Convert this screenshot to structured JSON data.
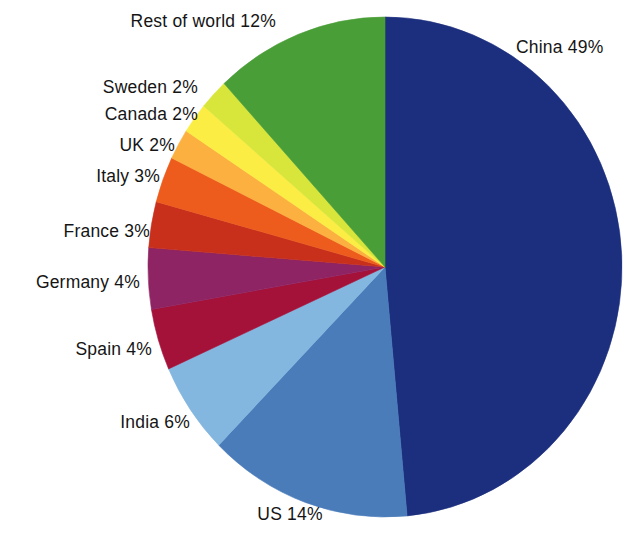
{
  "figure": {
    "type": "pie-chart",
    "background_color": "#ffffff",
    "label_text_color": "#151515",
    "center_x": 385,
    "center_y": 267,
    "radius_x": 237,
    "radius_y": 250,
    "start_angle_deg": -90,
    "direction": "clockwise"
  },
  "chart_data": {
    "type": "pie",
    "title": "",
    "xlabel": "",
    "ylabel": "",
    "legend_position": "none",
    "grid": false,
    "labels_show_percent": true,
    "total_percent": 101,
    "categories": [
      "China",
      "US",
      "India",
      "Spain",
      "Germany",
      "France",
      "Italy",
      "UK",
      "Canada",
      "Sweden",
      "Rest of world"
    ],
    "values": [
      49,
      14,
      6,
      4,
      4,
      3,
      3,
      2,
      2,
      2,
      12
    ],
    "colors": [
      "#1c2f7e",
      "#4a7cba",
      "#83b7e0",
      "#a4123a",
      "#8e2463",
      "#c8301c",
      "#ed5c1c",
      "#fbb040",
      "#fbed43",
      "#d8e53a",
      "#4a9e37"
    ],
    "slices": [
      {
        "label": "China 49%",
        "name": "China",
        "value": 49,
        "color": "#1c2f7e"
      },
      {
        "label": "US 14%",
        "name": "US",
        "value": 14,
        "color": "#4a7cba"
      },
      {
        "label": "India 6%",
        "name": "India",
        "value": 6,
        "color": "#83b7e0"
      },
      {
        "label": "Spain 4%",
        "name": "Spain",
        "value": 4,
        "color": "#a4123a"
      },
      {
        "label": "Germany 4%",
        "name": "Germany",
        "value": 4,
        "color": "#8e2463"
      },
      {
        "label": "France 3%",
        "name": "France",
        "value": 3,
        "color": "#c8301c"
      },
      {
        "label": "Italy 3%",
        "name": "Italy",
        "value": 3,
        "color": "#ed5c1c"
      },
      {
        "label": "UK 2%",
        "name": "UK",
        "value": 2,
        "color": "#fbb040"
      },
      {
        "label": "Canada 2%",
        "name": "Canada",
        "value": 2,
        "color": "#fbed43"
      },
      {
        "label": "Sweden 2%",
        "name": "Sweden",
        "value": 2,
        "color": "#d8e53a"
      },
      {
        "label": "Rest of world 12%",
        "name": "Rest of world",
        "value": 12,
        "color": "#4a9e37"
      }
    ]
  },
  "labels": {
    "china": {
      "text": "China 49%",
      "x": 516,
      "y": 38,
      "align": "left"
    },
    "rest_of_world": {
      "text": "Rest of world 12%",
      "x": 276,
      "y": 12,
      "align": "right"
    },
    "sweden": {
      "text": "Sweden 2%",
      "x": 198,
      "y": 78,
      "align": "right"
    },
    "canada": {
      "text": "Canada 2%",
      "x": 198,
      "y": 105,
      "align": "right"
    },
    "uk": {
      "text": "UK 2%",
      "x": 175,
      "y": 136,
      "align": "right"
    },
    "italy": {
      "text": "Italy 3%",
      "x": 160,
      "y": 167,
      "align": "right"
    },
    "france": {
      "text": "France 3%",
      "x": 150,
      "y": 222,
      "align": "right"
    },
    "germany": {
      "text": "Germany 4%",
      "x": 140,
      "y": 273,
      "align": "right"
    },
    "spain": {
      "text": "Spain 4%",
      "x": 152,
      "y": 340,
      "align": "right"
    },
    "india": {
      "text": "India 6%",
      "x": 190,
      "y": 413,
      "align": "right"
    },
    "us": {
      "text": "US 14%",
      "x": 268,
      "y": 505,
      "align": "center"
    }
  }
}
